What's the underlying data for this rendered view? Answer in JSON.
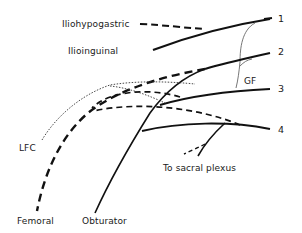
{
  "figure": {
    "type": "anatomical nerve diagram",
    "colors": {
      "nerve": "#111111",
      "gf_branch": "#777777",
      "lfc_branch": "#333333",
      "background": "#ffffff"
    },
    "roots": [
      {
        "label": "1"
      },
      {
        "label": "2"
      },
      {
        "label": "3"
      },
      {
        "label": "4"
      }
    ],
    "nerves": {
      "iliohypogastric": "Iliohypogastric",
      "ilioinguinal": "Ilioinguinal",
      "genitofemoral": "GF",
      "lateral_femoral_cutaneous": "LFC",
      "femoral": "Femoral",
      "obturator": "Obturator",
      "sacral": "To sacral plexus"
    },
    "line_styles": {
      "dashed": "posterior division",
      "solid": "anterior division"
    }
  }
}
